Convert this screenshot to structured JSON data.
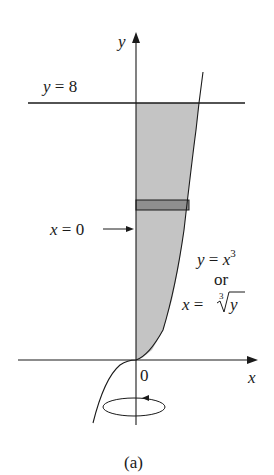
{
  "figure": {
    "caption": "(a)",
    "colors": {
      "background": "#ffffff",
      "region_fill": "#c4c4c4",
      "strip_fill": "#8f8f8f",
      "line": "#1a1a1a"
    }
  },
  "axes": {
    "x_label": "x",
    "y_label": "y",
    "origin_label": "0"
  },
  "labels": {
    "horizontal_line": {
      "lhs": "y",
      "eq": " = ",
      "rhs": "8"
    },
    "axis_line": {
      "lhs": "x",
      "eq": " = ",
      "rhs": "0"
    },
    "curve_eq1": {
      "lhs": "y",
      "eq": " = ",
      "rhs": "x",
      "exp": "3"
    },
    "curve_or": "or",
    "curve_eq2": {
      "lhs": "x",
      "eq": " = ",
      "root_index": "3",
      "radicand": "y"
    }
  },
  "rotation": {
    "axis": "y-axis",
    "indicator": "rotation-arrow"
  }
}
